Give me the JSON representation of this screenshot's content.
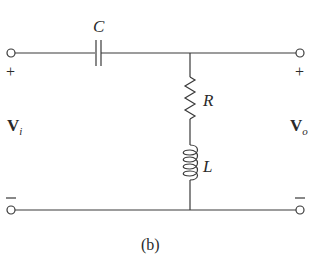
{
  "diagram": {
    "type": "circuit",
    "caption": "(b)",
    "components": {
      "capacitor": {
        "label": "C"
      },
      "resistor": {
        "label": "R"
      },
      "inductor": {
        "label": "L"
      }
    },
    "input": {
      "label_main": "V",
      "label_sub": "i",
      "plus": "+",
      "minus": "−"
    },
    "output": {
      "label_main": "V",
      "label_sub": "o",
      "plus": "+",
      "minus": "−"
    },
    "colors": {
      "wire": "#3a3a3a",
      "text": "#2a2a2a",
      "background": "#ffffff"
    }
  }
}
